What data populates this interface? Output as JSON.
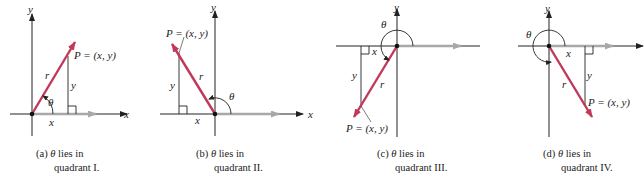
{
  "figure": {
    "panels": [
      {
        "id": "a",
        "quadrant": "I",
        "caption_line1_prefix": "(a) ",
        "caption_theta": "θ",
        "caption_line1_suffix": " lies in",
        "caption_line2": "quadrant I.",
        "point_label": "P = (x, y)",
        "labels": {
          "x_axis": "x",
          "y_axis": "y",
          "r": "r",
          "x": "x",
          "y": "y",
          "theta": "θ"
        }
      },
      {
        "id": "b",
        "quadrant": "II",
        "caption_line1_prefix": "(b) ",
        "caption_theta": "θ",
        "caption_line1_suffix": " lies in",
        "caption_line2": "quadrant II.",
        "point_label": "P = (x, y)",
        "labels": {
          "x_axis": "x",
          "y_axis": "y",
          "r": "r",
          "x": "x",
          "y": "y",
          "theta": "θ"
        }
      },
      {
        "id": "c",
        "quadrant": "III",
        "caption_line1_prefix": "(c) ",
        "caption_theta": "θ",
        "caption_line1_suffix": " lies in",
        "caption_line2": "quadrant III.",
        "point_label": "P = (x, y)",
        "labels": {
          "x_axis": "x",
          "y_axis": "y",
          "r": "r",
          "x": "x",
          "y": "y",
          "theta": "θ"
        }
      },
      {
        "id": "d",
        "quadrant": "IV",
        "caption_line1_prefix": "(d) ",
        "caption_theta": "θ",
        "caption_line1_suffix": " lies in",
        "caption_line2": "quadrant IV.",
        "point_label": "P = (x, y)",
        "labels": {
          "x_axis": "x",
          "y_axis": "y",
          "r": "r",
          "x": "x",
          "y": "y",
          "theta": "θ"
        }
      }
    ],
    "colors": {
      "axis": "#222222",
      "vector": "#c0395a",
      "initial_side": "#a8a8a8",
      "text": "#222222"
    }
  }
}
